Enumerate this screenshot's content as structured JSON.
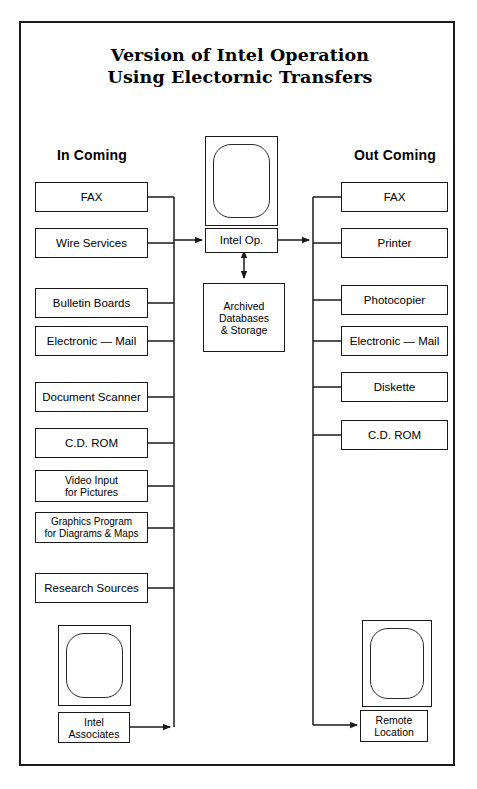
{
  "document": {
    "title_line1": "Version of Intel Operation",
    "title_line2": "Using Electornic Transfers"
  },
  "columns": {
    "incoming_heading": "In Coming",
    "outgoing_heading": "Out Coming"
  },
  "incoming": {
    "items": [
      {
        "label": "FAX"
      },
      {
        "label": "Wire Services"
      },
      {
        "label": "Bulletin Boards"
      },
      {
        "label": "Electronic — Mail"
      },
      {
        "label": "Document Scanner"
      },
      {
        "label": "C.D. ROM"
      },
      {
        "label": "Video Input\nfor Pictures"
      },
      {
        "label": "Graphics Program\nfor Diagrams & Maps"
      },
      {
        "label": "Research Sources"
      }
    ],
    "terminal": {
      "label": "Intel\nAssociates",
      "icon": "monitor-icon"
    }
  },
  "center": {
    "icon": "monitor-icon",
    "operation_label": "Intel Op.",
    "archive_label": "Archived\nDatabases\n& Storage"
  },
  "outgoing": {
    "items": [
      {
        "label": "FAX"
      },
      {
        "label": "Printer"
      },
      {
        "label": "Photocopier"
      },
      {
        "label": "Electronic — Mail"
      },
      {
        "label": "Diskette"
      },
      {
        "label": "C.D. ROM"
      }
    ],
    "terminal": {
      "label": "Remote\nLocation",
      "icon": "monitor-icon"
    }
  },
  "colors": {
    "ink": "#1a1a1a",
    "paper": "#ffffff"
  }
}
